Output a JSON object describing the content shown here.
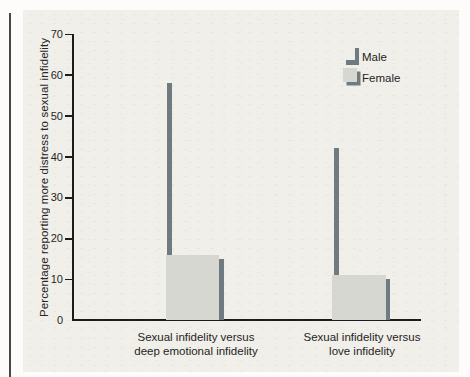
{
  "figure": {
    "panel_bg": "#f1efe9",
    "colors": {
      "male_bar": "#707a81",
      "female_bar": "#d6d7d1",
      "shadow": "#707a81",
      "axis": "#1c1c1c",
      "text": "#242424"
    }
  },
  "chart_data": {
    "type": "bar",
    "title": "",
    "xlabel": "",
    "ylabel": "Percentage reporting more distress to sexual infidelity",
    "ylim": [
      0,
      70
    ],
    "yticks": [
      0,
      10,
      20,
      30,
      40,
      50,
      60,
      70
    ],
    "grid": false,
    "legend_position": "upper right",
    "categories": [
      "Sexual infidelity versus deep emotional infidelity",
      "Sexual infidelity versus love infidelity"
    ],
    "categories_multiline": [
      [
        "Sexual infidelity versus",
        "deep emotional infidelity"
      ],
      [
        "Sexual infidelity versus",
        "love infidelity"
      ]
    ],
    "series": [
      {
        "name": "Male",
        "values": [
          58,
          42
        ],
        "color": "#707a81"
      },
      {
        "name": "Female",
        "values": [
          16,
          11
        ],
        "color": "#d6d7d1"
      }
    ]
  }
}
